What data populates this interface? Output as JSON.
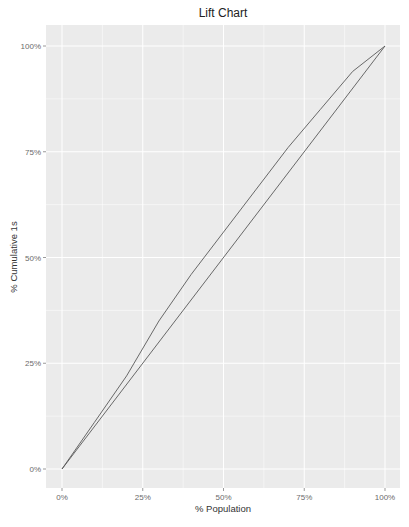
{
  "chart_data": {
    "type": "line",
    "title": "Lift Chart",
    "xlabel": "% Population",
    "ylabel": "% Cumulative 1s",
    "xlim": [
      0,
      100
    ],
    "ylim": [
      0,
      100
    ],
    "x_ticks": [
      "0%",
      "25%",
      "50%",
      "75%",
      "100%"
    ],
    "y_ticks": [
      "0%",
      "25%",
      "50%",
      "75%",
      "100%"
    ],
    "grid": true,
    "legend": null,
    "series": [
      {
        "name": "Model",
        "color": "#595959",
        "x": [
          0,
          10,
          20,
          30,
          40,
          50,
          60,
          70,
          80,
          90,
          100
        ],
        "values": [
          0,
          11,
          22,
          35,
          46,
          56,
          66,
          76,
          85,
          94,
          100
        ]
      },
      {
        "name": "Baseline",
        "color": "#595959",
        "x": [
          0,
          100
        ],
        "values": [
          0,
          100
        ]
      }
    ]
  },
  "colors": {
    "panel_bg": "#ebebeb",
    "grid": "#ffffff",
    "line": "#595959"
  }
}
